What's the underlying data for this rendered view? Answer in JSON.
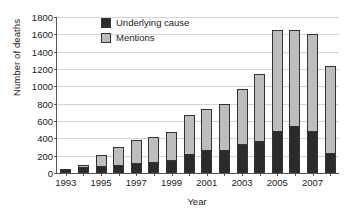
{
  "chart_data": {
    "type": "bar",
    "subtype": "stacked-vertical",
    "title": "",
    "xlabel": "Year",
    "ylabel": "Number of deaths",
    "ylim": [
      0,
      1800
    ],
    "ytick_step": 200,
    "yticks": [
      0,
      200,
      400,
      600,
      800,
      1000,
      1200,
      1400,
      1600,
      1800
    ],
    "ytick_labels": [
      "0",
      "200",
      "400",
      "600",
      "800",
      "1000",
      "1200",
      "1400",
      "1600",
      "1800"
    ],
    "grid": true,
    "grid_axis": "y",
    "legend_position": "top-left-inside",
    "categories": [
      "1993",
      "1994",
      "1995",
      "1996",
      "1997",
      "1998",
      "1999",
      "2000",
      "2001",
      "2002",
      "2003",
      "2004",
      "2005",
      "2006",
      "2007",
      "2008"
    ],
    "xtick_labels_shown": [
      "1993",
      "1995",
      "1997",
      "1999",
      "2001",
      "2003",
      "2005",
      "2007"
    ],
    "series": [
      {
        "name": "Underlying cause",
        "color": "#2b2b2b",
        "values": [
          45,
          65,
          85,
          90,
          120,
          130,
          155,
          215,
          270,
          270,
          340,
          375,
          490,
          540,
          480,
          235
        ]
      },
      {
        "name": "Mentions",
        "color": "#bdbdbd",
        "stacked_on": "Underlying cause",
        "note": "segment drawn above the dark segment; totals listed below",
        "values": [
          5,
          25,
          120,
          210,
          265,
          280,
          320,
          460,
          465,
          530,
          630,
          765,
          1160,
          1115,
          1120,
          995
        ]
      }
    ],
    "totals": [
      50,
      90,
      205,
      300,
      385,
      410,
      475,
      675,
      735,
      800,
      970,
      1140,
      1650,
      1655,
      1600,
      1230
    ]
  },
  "legend": {
    "items": [
      {
        "label": "Underlying cause",
        "color": "#2b2b2b"
      },
      {
        "label": "Mentions",
        "color": "#bdbdbd"
      }
    ]
  },
  "axes": {
    "y_title": "Number of deaths",
    "x_title": "Year"
  }
}
